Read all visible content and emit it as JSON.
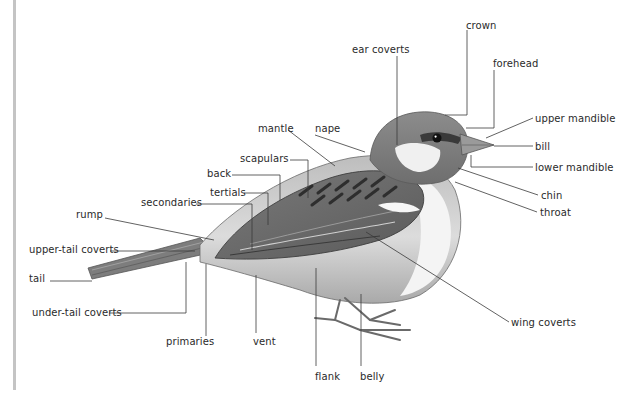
{
  "diagram": {
    "colors": {
      "background": "#ffffff",
      "label_text": "#2a2a2a",
      "leader_line": "#3a3a3a",
      "left_rule": "#c4c4c4",
      "plumage_dark": "#4a4a4a",
      "plumage_mid": "#8a8a8a",
      "plumage_light": "#d8d8d8",
      "cheek_white": "#f2f2f2"
    },
    "labels": [
      {
        "id": "crown",
        "text": "crown",
        "x": 466,
        "y": 20
      },
      {
        "id": "ear-coverts",
        "text": "ear coverts",
        "x": 352,
        "y": 44
      },
      {
        "id": "forehead",
        "text": "forehead",
        "x": 493,
        "y": 58
      },
      {
        "id": "upper-mandible",
        "text": "upper mandible",
        "x": 535,
        "y": 113
      },
      {
        "id": "mantle",
        "text": "mantle",
        "x": 258,
        "y": 123
      },
      {
        "id": "nape",
        "text": "nape",
        "x": 315,
        "y": 123
      },
      {
        "id": "bill",
        "text": "bill",
        "x": 535,
        "y": 141
      },
      {
        "id": "scapulars",
        "text": "scapulars",
        "x": 240,
        "y": 153
      },
      {
        "id": "lower-mandible",
        "text": "lower mandible",
        "x": 535,
        "y": 162
      },
      {
        "id": "back",
        "text": "back",
        "x": 207,
        "y": 168
      },
      {
        "id": "chin",
        "text": "chin",
        "x": 541,
        "y": 190
      },
      {
        "id": "tertials",
        "text": "tertials",
        "x": 210,
        "y": 187
      },
      {
        "id": "secondaries",
        "text": "secondaries",
        "x": 141,
        "y": 197
      },
      {
        "id": "throat",
        "text": "throat",
        "x": 540,
        "y": 207
      },
      {
        "id": "rump",
        "text": "rump",
        "x": 76,
        "y": 209
      },
      {
        "id": "upper-tail-coverts",
        "text": "upper-tail coverts",
        "x": 29,
        "y": 244
      },
      {
        "id": "tail",
        "text": "tail",
        "x": 29,
        "y": 273
      },
      {
        "id": "under-tail-coverts",
        "text": "under-tail coverts",
        "x": 32,
        "y": 307
      },
      {
        "id": "wing-coverts",
        "text": "wing coverts",
        "x": 511,
        "y": 317
      },
      {
        "id": "primaries",
        "text": "primaries",
        "x": 166,
        "y": 336
      },
      {
        "id": "vent",
        "text": "vent",
        "x": 253,
        "y": 336
      },
      {
        "id": "flank",
        "text": "flank",
        "x": 315,
        "y": 371
      },
      {
        "id": "belly",
        "text": "belly",
        "x": 360,
        "y": 371
      }
    ]
  }
}
